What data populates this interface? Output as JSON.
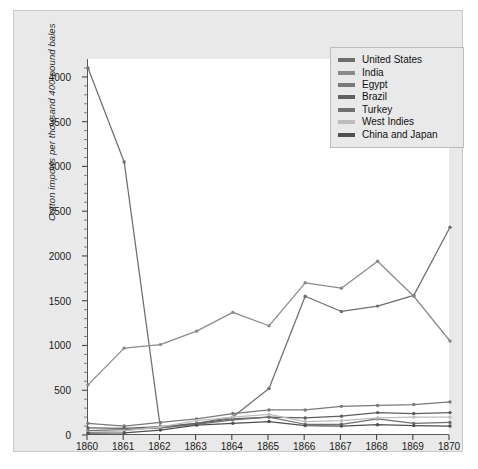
{
  "chart_data": {
    "type": "line",
    "title": "",
    "xlabel": "",
    "ylabel": "Cotton imports per thousand 400-pound bales",
    "categories": [
      "1860",
      "1861",
      "1862",
      "1863",
      "1864",
      "1865",
      "1866",
      "1867",
      "1868",
      "1869",
      "1870"
    ],
    "x": [
      1860,
      1861,
      1862,
      1863,
      1864,
      1865,
      1866,
      1867,
      1868,
      1869,
      1870
    ],
    "xlim": [
      1860,
      1870
    ],
    "ylim": [
      0,
      4200
    ],
    "yticks": [
      0,
      500,
      1000,
      1500,
      2000,
      2500,
      3000,
      3500,
      4000
    ],
    "ytick_labels": [
      "0",
      "500",
      "1000",
      "1500",
      "2000",
      "2500",
      "3000",
      "3500",
      "4000"
    ],
    "grid": false,
    "legend_position": "top-right",
    "series": [
      {
        "name": "United States",
        "color": "#6e6e6e",
        "values": [
          4100,
          3050,
          80,
          130,
          200,
          520,
          1550,
          1380,
          1440,
          1560,
          2320
        ]
      },
      {
        "name": "India",
        "color": "#8a8a8a",
        "values": [
          560,
          970,
          1010,
          1160,
          1370,
          1220,
          1700,
          1640,
          1940,
          1550,
          1050
        ]
      },
      {
        "name": "Egypt",
        "color": "#7a7a7a",
        "values": [
          130,
          100,
          140,
          180,
          240,
          280,
          280,
          320,
          330,
          340,
          370
        ]
      },
      {
        "name": "Brazil",
        "color": "#5f5f5f",
        "values": [
          80,
          75,
          95,
          130,
          180,
          200,
          190,
          210,
          250,
          240,
          250
        ]
      },
      {
        "name": "Turkey",
        "color": "#707070",
        "values": [
          50,
          60,
          80,
          120,
          170,
          200,
          120,
          120,
          180,
          130,
          140
        ]
      },
      {
        "name": "West Indies",
        "color": "#bdbdbd",
        "values": [
          30,
          45,
          90,
          160,
          200,
          230,
          150,
          160,
          190,
          200,
          200
        ]
      },
      {
        "name": "China and Japan",
        "color": "#4f4f4f",
        "values": [
          20,
          25,
          55,
          110,
          130,
          150,
          105,
          100,
          115,
          105,
          100
        ]
      }
    ]
  },
  "legend": {
    "items": [
      {
        "label": "United States"
      },
      {
        "label": "India"
      },
      {
        "label": "Egypt"
      },
      {
        "label": "Brazil"
      },
      {
        "label": "Turkey"
      },
      {
        "label": "West Indies"
      },
      {
        "label": "China and Japan"
      }
    ]
  }
}
